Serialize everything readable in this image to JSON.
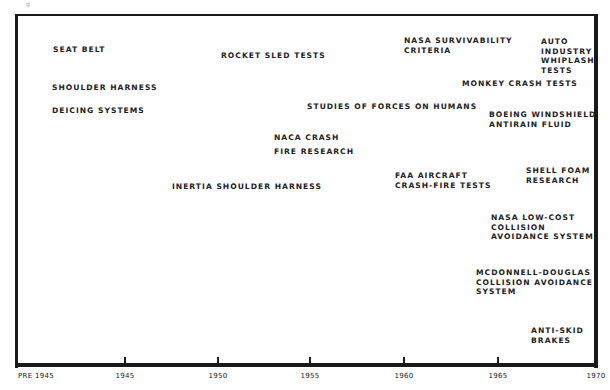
{
  "chart_data": {
    "type": "timeline",
    "title": "",
    "xlabel": "",
    "ylabel": "",
    "x_ticks": [
      "PRE 1945",
      "1945",
      "1950",
      "1955",
      "1960",
      "1965",
      "1970"
    ],
    "x_range": [
      "PRE 1945",
      "1970"
    ],
    "grid": false,
    "events": [
      {
        "label": "SEAT BELT",
        "period": "PRE 1945"
      },
      {
        "label": "SHOULDER HARNESS",
        "period": "PRE 1945"
      },
      {
        "label": "DEICING SYSTEMS",
        "period": "PRE 1945"
      },
      {
        "label": "ROCKET SLED TESTS",
        "period": "~1950-1955"
      },
      {
        "label": "INERTIA SHOULDER HARNESS",
        "period": "~1948-1955"
      },
      {
        "label": "NACA CRASH FIRE RESEARCH",
        "period": "~1953-1958"
      },
      {
        "label": "STUDIES OF FORCES ON HUMANS",
        "period": "~1955-1964"
      },
      {
        "label": "NASA SURVIVABILITY CRITERIA",
        "period": "~1960-1966"
      },
      {
        "label": "FAA AIRCRAFT CRASH-FIRE TESTS",
        "period": "~1960-1965"
      },
      {
        "label": "MONKEY CRASH TESTS",
        "period": "~1963-1970"
      },
      {
        "label": "AUTO INDUSTRY WHIPLASH TESTS",
        "period": "~1967-1970"
      },
      {
        "label": "BOEING WINDSHIELD ANTIRAIN FLUID",
        "period": "~1965-1970"
      },
      {
        "label": "SHELL FOAM RESEARCH",
        "period": "~1967-1970"
      },
      {
        "label": "NASA LOW-COST COLLISION AVOIDANCE SYSTEM",
        "period": "~1965-1970"
      },
      {
        "label": "MCDONNELL-DOUGLAS COLLISION AVOIDANCE SYSTEM",
        "period": "~1964-1970"
      },
      {
        "label": "ANTI-SKID BRAKES",
        "period": "~1967-1970"
      }
    ]
  },
  "corner_mark": "g",
  "axis": {
    "ticks": [
      {
        "label": "PRE 1945",
        "x": 18
      },
      {
        "label": "1945",
        "x": 125
      },
      {
        "label": "1950",
        "x": 218
      },
      {
        "label": "1955",
        "x": 310
      },
      {
        "label": "1960",
        "x": 404
      },
      {
        "label": "1965",
        "x": 498
      },
      {
        "label": "1970",
        "x": 596
      }
    ]
  },
  "events": [
    {
      "text": "SEAT BELT",
      "x": 53,
      "y": 45
    },
    {
      "text": "SHOULDER HARNESS",
      "x": 52,
      "y": 83
    },
    {
      "text": "DEICING SYSTEMS",
      "x": 52,
      "y": 106
    },
    {
      "text": "ROCKET SLED TESTS",
      "x": 221,
      "y": 51
    },
    {
      "text": "NACA CRASH",
      "x": 274,
      "y": 133
    },
    {
      "text": "FIRE RESEARCH",
      "x": 274,
      "y": 147
    },
    {
      "text": "INERTIA SHOULDER HARNESS",
      "x": 172,
      "y": 182
    },
    {
      "text": "STUDIES OF FORCES ON HUMANS",
      "x": 307,
      "y": 102
    },
    {
      "text": "NASA SURVIVABILITY\nCRITERIA",
      "x": 404,
      "y": 36
    },
    {
      "text": "AUTO\nINDUSTRY\nWHIPLASH\nTESTS",
      "x": 541,
      "y": 37
    },
    {
      "text": "MONKEY CRASH TESTS",
      "x": 462,
      "y": 79
    },
    {
      "text": "BOEING WINDSHIELD\nANTIRAIN FLUID",
      "x": 489,
      "y": 110
    },
    {
      "text": "FAA AIRCRAFT\nCRASH-FIRE TESTS",
      "x": 395,
      "y": 171
    },
    {
      "text": "SHELL FOAM\nRESEARCH",
      "x": 526,
      "y": 166
    },
    {
      "text": "NASA LOW-COST\nCOLLISION\nAVOIDANCE SYSTEM",
      "x": 491,
      "y": 213
    },
    {
      "text": "MCDONNELL-DOUGLAS\nCOLLISION AVOIDANCE\nSYSTEM",
      "x": 476,
      "y": 268
    },
    {
      "text": "ANTI-SKID\nBRAKES",
      "x": 531,
      "y": 326
    }
  ]
}
